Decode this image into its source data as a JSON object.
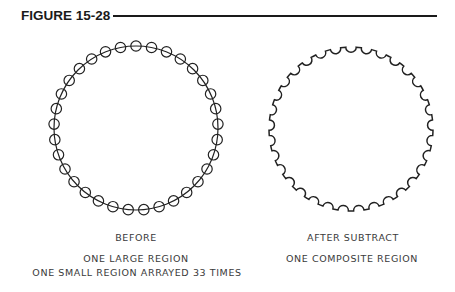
{
  "figure": {
    "title": "FIGURE 15-28"
  },
  "left_panel": {
    "label": "BEFORE",
    "description_lines": [
      "ONE LARGE REGION",
      "ONE SMALL REGION ARRAYED 33 TIMES"
    ],
    "large_circle": {
      "cx": 136,
      "cy": 128,
      "r": 82
    },
    "small_circle": {
      "r": 5.2,
      "count": 33
    }
  },
  "right_panel": {
    "label": "AFTER SUBTRACT",
    "description_lines": [
      "ONE COMPOSITE REGION"
    ],
    "composite": {
      "cx": 351,
      "cy": 129,
      "r": 82,
      "bite_r": 5.2,
      "count": 33
    }
  },
  "colors": {
    "stroke": "#222222",
    "text": "#3a3a3a"
  }
}
